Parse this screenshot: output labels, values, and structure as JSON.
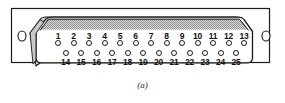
{
  "figure": {
    "caption": "(a)",
    "colors": {
      "outline": "#1a1a1a",
      "shell_fill": "#ffffff",
      "shade_band": "#b4b4b4",
      "background": "#ffffff"
    }
  },
  "connector": {
    "type": "DB-25",
    "total_pins": 25,
    "rows": [
      {
        "name": "top-row",
        "pin_count": 13,
        "labels": [
          "1",
          "2",
          "3",
          "4",
          "5",
          "6",
          "7",
          "8",
          "9",
          "10",
          "11",
          "12",
          "13"
        ],
        "label_position": "above"
      },
      {
        "name": "bottom-row",
        "pin_count": 12,
        "labels": [
          "14",
          "15",
          "16",
          "17",
          "18",
          "19",
          "20",
          "21",
          "22",
          "23",
          "24",
          "25"
        ],
        "label_position": "below"
      }
    ],
    "mounting_holes": [
      {
        "name": "left-mounting-hole"
      },
      {
        "name": "right-mounting-hole"
      }
    ]
  }
}
